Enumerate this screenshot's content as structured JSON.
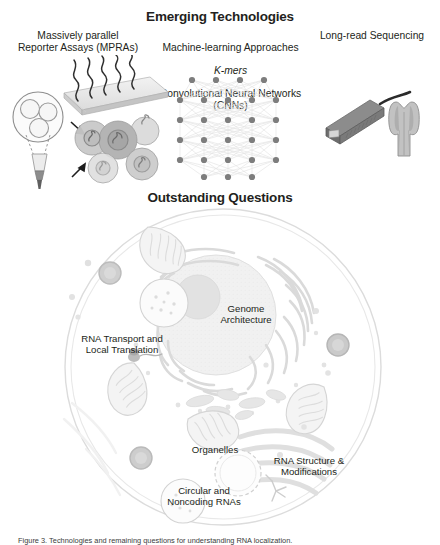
{
  "figure": {
    "sections": {
      "emerging": {
        "heading": "Emerging Technologies"
      },
      "outstanding": {
        "heading": "Outstanding Questions"
      }
    },
    "technologies": [
      {
        "id": "mpra",
        "label": "Massively parallel\nReporter Assays (MPRAs)",
        "icon": "microarray-plate-icon"
      },
      {
        "id": "ml",
        "label_line1": "Machine-learning Approaches",
        "label_line2": "K-mers",
        "label_line3": "Convolutional Neural Networks (CNNs)",
        "icon": "neural-network-icon"
      },
      {
        "id": "lrs",
        "label": "Long-read Sequencing",
        "icon": "nanopore-sequencer-icon"
      }
    ],
    "questions": [
      {
        "id": "genome",
        "label": "Genome\nArchitecture"
      },
      {
        "id": "rnatrans",
        "label": "RNA Transport and\nLocal Translation"
      },
      {
        "id": "organelles",
        "label": "Organelles"
      },
      {
        "id": "rnastruct",
        "label": "RNA Structure &\nModifications"
      },
      {
        "id": "circrna",
        "label": "Circular and\nNoncoding RNAs"
      }
    ],
    "caption": "Figure 3. Technologies and remaining questions for understanding RNA localization.",
    "colors": {
      "text": "#231f20",
      "cell_outline": "#d8d8d8",
      "organelle_light": "#ededed",
      "organelle_mid": "#cfcfcf",
      "organelle_dark": "#b5b5b5",
      "device_dark": "#6f6f6f",
      "network_node": "#808080",
      "network_edge": "#e2e2e2"
    }
  }
}
